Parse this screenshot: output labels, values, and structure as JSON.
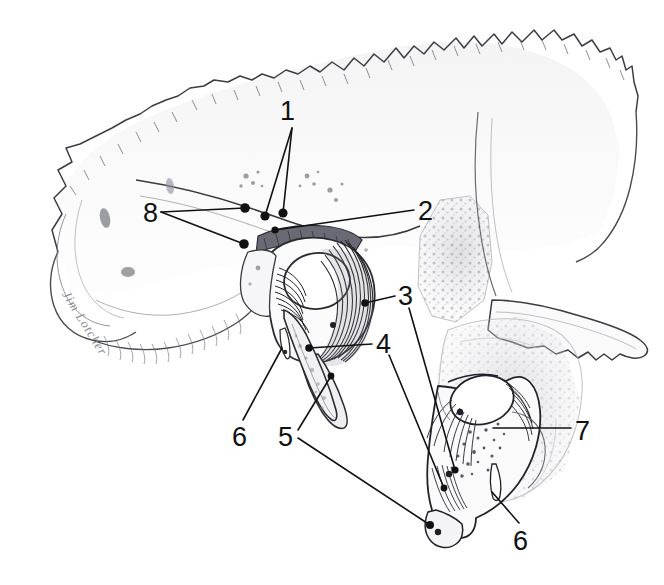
{
  "figure": {
    "kind": "anatomical-line-drawing",
    "background_color": "#ffffff",
    "ink_color": "#111111",
    "shade_color": "#9a9aa2",
    "signature": "Jim Lotcher"
  },
  "labels": [
    {
      "id": "1",
      "text": "1",
      "x": 280,
      "y": 98
    },
    {
      "id": "2",
      "text": "2",
      "x": 418,
      "y": 198
    },
    {
      "id": "3",
      "text": "3",
      "x": 398,
      "y": 283
    },
    {
      "id": "4",
      "text": "4",
      "x": 376,
      "y": 331
    },
    {
      "id": "5",
      "text": "5",
      "x": 278,
      "y": 424
    },
    {
      "id": "6a",
      "text": "6",
      "x": 232,
      "y": 424
    },
    {
      "id": "6b",
      "text": "6",
      "x": 513,
      "y": 528
    },
    {
      "id": "7",
      "text": "7",
      "x": 575,
      "y": 418
    },
    {
      "id": "8",
      "text": "8",
      "x": 143,
      "y": 200
    }
  ],
  "leaders": [
    {
      "id": "leader-1-a",
      "from_label": "1",
      "points": "292,128 283,213",
      "dot": [
        283,
        213
      ]
    },
    {
      "id": "leader-1-b",
      "from_label": "1",
      "points": "292,128 265,216",
      "dot": [
        265,
        216
      ]
    },
    {
      "id": "leader-8-a",
      "from_label": "8",
      "points": "161,212 245,208",
      "dot": [
        245,
        208
      ]
    },
    {
      "id": "leader-8-b",
      "from_label": "8",
      "points": "161,212 244,244",
      "dot": [
        244,
        244
      ]
    },
    {
      "id": "leader-2",
      "from_label": "2",
      "points": "414,210 275,230",
      "dot": [
        275,
        230
      ]
    },
    {
      "id": "leader-3-a",
      "from_label": "3",
      "points": "395,296 365,303",
      "dot": [
        365,
        303
      ]
    },
    {
      "id": "leader-3-b",
      "from_label": "3",
      "points": "409,308 455,470",
      "dot": [
        455,
        470
      ]
    },
    {
      "id": "leader-4-a",
      "from_label": "4",
      "points": "372,344 309,348",
      "dot": [
        309,
        348
      ]
    },
    {
      "id": "leader-4-b",
      "from_label": "4",
      "points": "389,355 444,488",
      "dot": [
        444,
        488
      ]
    },
    {
      "id": "leader-5-a",
      "from_label": "5",
      "points": "298,430 331,376",
      "dot": [
        331,
        376
      ]
    },
    {
      "id": "leader-5-b",
      "from_label": "5",
      "points": "298,438 430,525",
      "dot": [
        430,
        525
      ]
    },
    {
      "id": "leader-6a",
      "from_label": "6a",
      "points": "243,420 282,348",
      "dot": null
    },
    {
      "id": "leader-6b",
      "from_label": "6b",
      "points": "519,523 492,492",
      "dot": null
    },
    {
      "id": "leader-7",
      "from_label": "7",
      "points": "571,428 493,428",
      "dot": null
    }
  ],
  "structures": [
    {
      "id": "squamous-temporal",
      "name": "squamous part of temporal bone with serrated suture margin"
    },
    {
      "id": "zygomatic-process",
      "name": "zygomatic process extending posteriorly-right"
    },
    {
      "id": "mastoid-region",
      "name": "mastoid / petrous region with porous trabecular stipple"
    },
    {
      "id": "tympanic-ring",
      "name": "tympanic ring with striated annular fibers"
    },
    {
      "id": "styloid-process",
      "name": "styloid process"
    },
    {
      "id": "detached-ossicle",
      "name": "detached lower ossicle with radiating fibers"
    }
  ]
}
